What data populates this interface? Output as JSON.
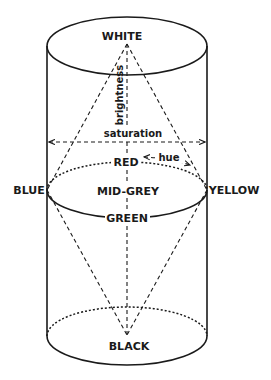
{
  "diagram": {
    "type": "hsb-color-cylinder-double-cone",
    "labels": {
      "top": "WHITE",
      "bottom": "BLACK",
      "left": "BLUE",
      "right": "YELLOW",
      "center": "MID-GREY",
      "front_top": "RED",
      "front_bottom": "GREEN"
    },
    "axes": {
      "vertical": "brightness",
      "horizontal": "saturation",
      "circular": "hue"
    },
    "colors": {
      "ink": "#1a1a1a",
      "background": "#ffffff"
    }
  }
}
